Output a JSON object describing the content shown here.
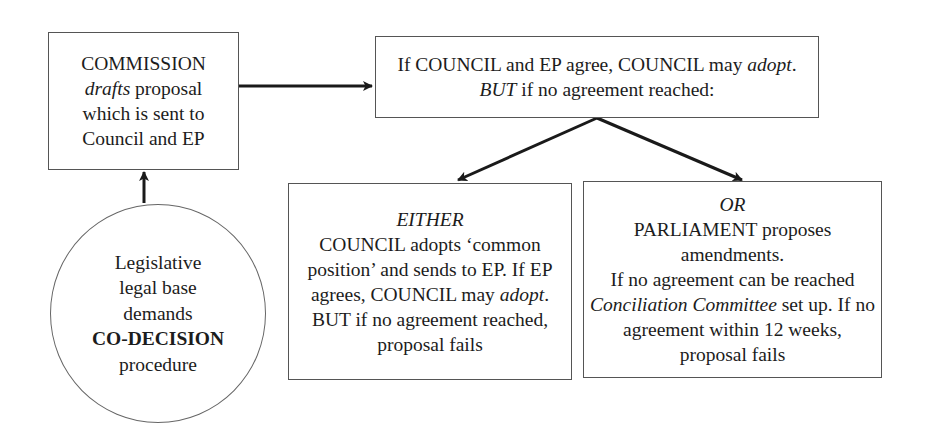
{
  "diagram": {
    "commission_box": {
      "lines": [
        {
          "parts": [
            {
              "text": "COMMISSION",
              "style": "normal"
            }
          ]
        },
        {
          "parts": [
            {
              "text": "drafts",
              "style": "italic"
            },
            {
              "text": " proposal",
              "style": "normal"
            }
          ]
        },
        {
          "parts": [
            {
              "text": "which is sent to",
              "style": "normal"
            }
          ]
        },
        {
          "parts": [
            {
              "text": "Council and EP",
              "style": "normal"
            }
          ]
        }
      ]
    },
    "legal_base_circle": {
      "lines": [
        {
          "parts": [
            {
              "text": "Legislative",
              "style": "normal"
            }
          ]
        },
        {
          "parts": [
            {
              "text": "legal base",
              "style": "normal"
            }
          ]
        },
        {
          "parts": [
            {
              "text": "demands",
              "style": "normal"
            }
          ]
        },
        {
          "parts": [
            {
              "text": "CO-DECISION",
              "style": "bold"
            }
          ]
        },
        {
          "parts": [
            {
              "text": "procedure",
              "style": "normal"
            }
          ]
        }
      ]
    },
    "agreement_box": {
      "lines": [
        {
          "parts": [
            {
              "text": "If COUNCIL and EP agree, COUNCIL may ",
              "style": "normal"
            },
            {
              "text": "adopt",
              "style": "italic"
            },
            {
              "text": ".",
              "style": "normal"
            }
          ]
        },
        {
          "parts": [
            {
              "text": "BUT",
              "style": "italic"
            },
            {
              "text": " if no agreement reached:",
              "style": "normal"
            }
          ]
        }
      ]
    },
    "either_box": {
      "lines": [
        {
          "parts": [
            {
              "text": "EITHER",
              "style": "italic"
            }
          ]
        },
        {
          "parts": [
            {
              "text": "COUNCIL adopts ‘common",
              "style": "normal"
            }
          ]
        },
        {
          "parts": [
            {
              "text": "position’ and sends to EP. If EP",
              "style": "normal"
            }
          ]
        },
        {
          "parts": [
            {
              "text": "agrees, COUNCIL may ",
              "style": "normal"
            },
            {
              "text": "adopt",
              "style": "italic"
            },
            {
              "text": ".",
              "style": "normal"
            }
          ]
        },
        {
          "parts": [
            {
              "text": "BUT if no agreement reached,",
              "style": "normal"
            }
          ]
        },
        {
          "parts": [
            {
              "text": "proposal fails",
              "style": "normal"
            }
          ]
        }
      ]
    },
    "or_box": {
      "lines": [
        {
          "parts": [
            {
              "text": "OR",
              "style": "italic"
            }
          ]
        },
        {
          "parts": [
            {
              "text": "PARLIAMENT proposes",
              "style": "normal"
            }
          ]
        },
        {
          "parts": [
            {
              "text": "amendments.",
              "style": "normal"
            }
          ]
        },
        {
          "parts": [
            {
              "text": "If no agreement can be reached",
              "style": "normal"
            }
          ]
        },
        {
          "parts": [
            {
              "text": "Conciliation Committee",
              "style": "italic"
            },
            {
              "text": " set up. If no",
              "style": "normal"
            }
          ]
        },
        {
          "parts": [
            {
              "text": "agreement within 12 weeks,",
              "style": "normal"
            }
          ]
        },
        {
          "parts": [
            {
              "text": "proposal fails",
              "style": "normal"
            }
          ]
        }
      ]
    },
    "arrows": [
      {
        "from": "legal_base_circle",
        "to": "commission_box"
      },
      {
        "from": "commission_box",
        "to": "agreement_box"
      },
      {
        "from": "agreement_box",
        "to": "either_box"
      },
      {
        "from": "agreement_box",
        "to": "or_box"
      }
    ],
    "colors": {
      "line": "#1a1a1a",
      "border": "#555555",
      "text": "#1c1c1c"
    }
  }
}
